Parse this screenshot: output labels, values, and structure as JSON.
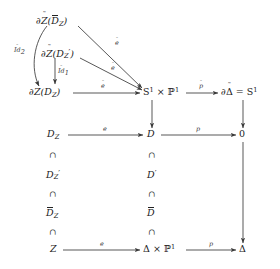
{
  "diagram": {
    "stroke_color": "#3a3a3a",
    "text_color": "#222222",
    "nodes": {
      "dz_dbar_z": {
        "base": "∂",
        "accent_sym": "Z",
        "inner": "D",
        "inner_accent": "bar",
        "inner_sub": "Z",
        "label": "∂Ž(D̄_Z)"
      },
      "dz_dprime_z": {
        "label": "∂Ž(D′_Z)"
      },
      "dz_d_z": {
        "label": "∂Ž(D_Z)"
      },
      "s1_p1": {
        "label": "S¹ × ℙ¹"
      },
      "d_delta_s1": {
        "label": "∂Δ̃ = S¹"
      },
      "d_z": {
        "label": "D_Z"
      },
      "d": {
        "label": "D"
      },
      "zero": {
        "label": "0"
      },
      "dprime_z": {
        "label": "D′_Z"
      },
      "dprime": {
        "label": "D′"
      },
      "dbar_z": {
        "label": "D̄_Z"
      },
      "dbar": {
        "label": "D̄"
      },
      "z": {
        "label": "Z"
      },
      "delta_p1": {
        "label": "Δ × ℙ¹"
      },
      "delta": {
        "label": "Δ"
      }
    },
    "letters": {
      "partial": "∂",
      "Z": "Z",
      "D": "D",
      "S": "S",
      "P": "ℙ",
      "Delta": "Δ",
      "zero": "0",
      "times": "×",
      "equals": "=",
      "one_sup": "1",
      "sub_Z": "Z",
      "prime": "′",
      "tilde": "˜",
      "hat": "̂",
      "subset": "∩"
    },
    "arrow_labels": {
      "e_tilde_main": "e",
      "e_tilde_diag_upper": "e",
      "e_tilde_diag_lower": "e",
      "p_tilde": "p",
      "e_mid": "e",
      "p_mid": "p",
      "e_bottom": "e",
      "p_bottom": "p",
      "id_tilde_2": "Id",
      "id_tilde_2_sub": "2",
      "id_tilde_1": "Id",
      "id_tilde_1_sub": "1"
    },
    "inclusions": [
      "∩",
      "∩",
      "∩",
      "∩",
      "∩",
      "∩"
    ]
  }
}
